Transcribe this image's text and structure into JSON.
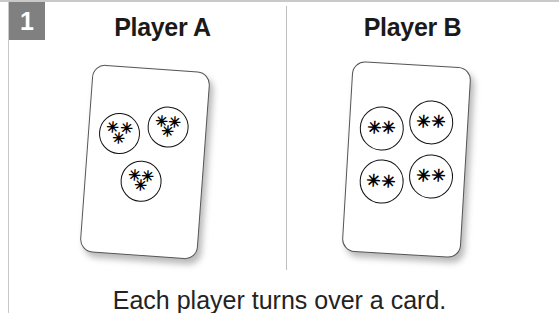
{
  "step": {
    "number": "1"
  },
  "panels": [
    {
      "heading": "Player A",
      "card": {
        "circles": [
          {
            "rows": [
              "✳✳",
              "✳"
            ]
          },
          {
            "rows": [
              "✳✳",
              "✳"
            ]
          },
          {
            "rows": [
              "✳✳",
              "✳"
            ]
          }
        ]
      }
    },
    {
      "heading": "Player B",
      "card": {
        "circles": [
          {
            "rows": [
              "✳✳"
            ]
          },
          {
            "rows": [
              "✳✳"
            ]
          },
          {
            "rows": [
              "✳✳"
            ]
          },
          {
            "rows": [
              "✳✳"
            ]
          }
        ]
      }
    }
  ],
  "caption": "Each player turns over a card.",
  "colors": {
    "badge_background": "#808080",
    "badge_text": "#ffffff",
    "heading_text": "#1a1a1a",
    "caption_text": "#232323",
    "card_outline": "#555555",
    "circle_outline": "#111111",
    "divider": "#bfbfbf",
    "page_background": "#ffffff"
  }
}
